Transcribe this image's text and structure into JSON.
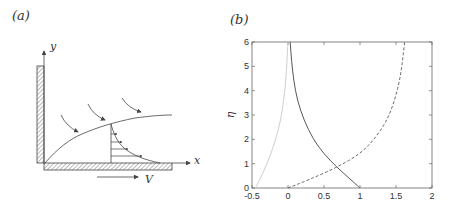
{
  "figure": {
    "panel_a": {
      "label": "(a)",
      "axis_x": "x",
      "axis_y": "y",
      "velocity_label": "V"
    },
    "panel_b": {
      "label": "(b)",
      "ylabel": "η"
    }
  },
  "chart_data": [
    {
      "panel": "(a)",
      "type": "diagram",
      "description": "Boundary layer on a moving plate next to a vertical wall; curved arrows show the inflow, a velocity profile sits inside the layer, and the plate moves with velocity V along x",
      "labels": [
        "x",
        "y",
        "V"
      ]
    },
    {
      "panel": "(b)",
      "type": "line",
      "title": "",
      "xlabel": "",
      "ylabel": "η",
      "xlim": [
        -0.5,
        2
      ],
      "ylim": [
        0,
        6
      ],
      "xticks": [
        "-0.5",
        "0",
        "0.5",
        "1",
        "1.5",
        "2"
      ],
      "yticks": [
        "0",
        "1",
        "2",
        "3",
        "4",
        "5",
        "6"
      ],
      "grid": false,
      "legend": null,
      "series": [
        {
          "name": "solid",
          "style": "solid",
          "color": "#444444",
          "x": [
            1.0,
            0.85,
            0.68,
            0.5,
            0.35,
            0.22,
            0.13,
            0.08,
            0.05,
            0.03
          ],
          "y": [
            0,
            0.4,
            0.85,
            1.4,
            2.0,
            2.8,
            3.6,
            4.4,
            5.2,
            6.0
          ]
        },
        {
          "name": "dashed",
          "style": "dashed",
          "color": "#555555",
          "x": [
            0.0,
            0.3,
            0.68,
            1.0,
            1.2,
            1.38,
            1.48,
            1.55,
            1.59,
            1.62
          ],
          "y": [
            0,
            0.35,
            0.85,
            1.4,
            2.0,
            2.8,
            3.6,
            4.4,
            5.2,
            6.0
          ]
        },
        {
          "name": "light",
          "style": "solid",
          "color": "#c8c8c8",
          "x": [
            -0.45,
            -0.35,
            -0.25,
            -0.17,
            -0.1,
            -0.06,
            -0.03,
            -0.015,
            0.0
          ],
          "y": [
            0,
            0.6,
            1.3,
            2.0,
            2.8,
            3.6,
            4.4,
            5.2,
            6.0
          ]
        }
      ]
    }
  ]
}
